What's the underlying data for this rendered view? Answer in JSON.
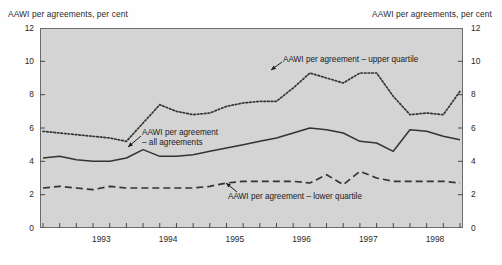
{
  "figure": {
    "left_axis_title": "AAWI per agreements, per cent",
    "right_axis_title": "AAWI per agreements, per cent"
  },
  "annotations": {
    "upper": "AAWI per agreement – upper quartile",
    "all_line1": "AAWI per agreement",
    "all_line2": "– all agreements",
    "lower": "AAWI per agreement – lower quartile"
  },
  "chart_data": {
    "type": "line",
    "title": "",
    "xlabel": "",
    "ylabel": "AAWI per agreements, per cent",
    "ylim": [
      0,
      12
    ],
    "yticks": [
      0,
      2,
      4,
      6,
      8,
      10,
      12
    ],
    "xticks_major": [
      "1993",
      "1994",
      "1995",
      "1996",
      "1997",
      "1998"
    ],
    "xtick_minor_interval": "quarterly",
    "grid": false,
    "legend": "inline-annotations",
    "x": [
      "1992Q3",
      "1992Q4",
      "1993Q1",
      "1993Q2",
      "1993Q3",
      "1993Q4",
      "1994Q1",
      "1994Q2",
      "1994Q3",
      "1994Q4",
      "1995Q1",
      "1995Q2",
      "1995Q3",
      "1995Q4",
      "1996Q1",
      "1996Q2",
      "1996Q3",
      "1996Q4",
      "1997Q1",
      "1997Q2",
      "1997Q3",
      "1997Q4",
      "1998Q1",
      "1998Q2",
      "1998Q3",
      "1998Q4"
    ],
    "series": [
      {
        "name": "AAWI per agreement – upper quartile",
        "style": "dotted",
        "color": "#333333",
        "values": [
          5.8,
          5.7,
          5.6,
          5.5,
          5.4,
          5.2,
          6.3,
          7.4,
          7.0,
          6.8,
          6.9,
          7.3,
          7.5,
          7.6,
          7.6,
          8.4,
          9.3,
          9.0,
          8.7,
          9.3,
          9.3,
          7.9,
          6.8,
          6.9,
          6.8,
          8.2
        ]
      },
      {
        "name": "AAWI per agreement – all agreements",
        "style": "solid",
        "color": "#333333",
        "values": [
          4.2,
          4.3,
          4.1,
          4.0,
          4.0,
          4.2,
          4.7,
          4.3,
          4.3,
          4.4,
          4.6,
          4.8,
          5.0,
          5.2,
          5.4,
          5.7,
          6.0,
          5.9,
          5.7,
          5.2,
          5.1,
          4.6,
          5.9,
          5.8,
          5.5,
          5.3
        ]
      },
      {
        "name": "AAWI per agreement – lower quartile",
        "style": "dashed",
        "color": "#333333",
        "values": [
          2.4,
          2.5,
          2.4,
          2.3,
          2.5,
          2.4,
          2.4,
          2.4,
          2.4,
          2.4,
          2.5,
          2.7,
          2.8,
          2.8,
          2.8,
          2.8,
          2.7,
          3.2,
          2.6,
          3.4,
          3.0,
          2.8,
          2.8,
          2.8,
          2.8,
          2.7
        ]
      }
    ]
  }
}
